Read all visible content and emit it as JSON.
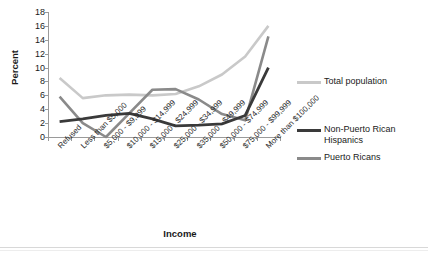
{
  "chart_data": {
    "type": "line",
    "title": "",
    "xlabel": "Income",
    "ylabel": "Percent",
    "ylim": [
      0,
      18
    ],
    "ytick_step": 2,
    "yticks": [
      0,
      2,
      4,
      6,
      8,
      10,
      12,
      14,
      16,
      18
    ],
    "grid": false,
    "legend_position": "right",
    "categories": [
      "Refused",
      "Less than $5,000",
      "$5,000 - $9,999",
      "$10,000 - $14,999",
      "$15,000 - $24,999",
      "$25,000 - $34,999",
      "$35,000 - $49,999",
      "$50,000 - $74,999",
      "$75,000 - $99,999",
      "More than $100,000"
    ],
    "series": [
      {
        "name": "Total population",
        "color": "#c9c9c9",
        "values": [
          8.5,
          5.6,
          6.0,
          6.1,
          6.0,
          6.2,
          7.3,
          9.0,
          11.6,
          16.0
        ]
      },
      {
        "name": "Non-Puerto Rican Hispanics",
        "color": "#3a3a3a",
        "values": [
          2.2,
          2.6,
          3.1,
          3.4,
          2.6,
          1.6,
          1.7,
          1.9,
          3.1,
          4.0
        ]
      },
      {
        "name": "Puerto Ricans",
        "color": "#8a8a8a",
        "values": [
          5.8,
          2.0,
          0.0,
          3.4,
          6.8,
          6.9,
          5.4,
          3.3,
          2.4,
          3.2
        ]
      }
    ],
    "series_endpoints": {
      "non_puerto_rican_hispanics_final": 10.0,
      "puerto_ricans_final": 14.5
    }
  },
  "axes": {
    "y_title": "Percent",
    "x_title": "Income",
    "y_tick_labels": [
      "18",
      "16",
      "14",
      "12",
      "10",
      "8",
      "6",
      "4",
      "2",
      "0"
    ]
  },
  "legend": {
    "items": [
      {
        "label": "Total population",
        "color": "#c9c9c9"
      },
      {
        "label": "Non-Puerto Rican Hispanics",
        "color": "#3a3a3a"
      },
      {
        "label": "Puerto Ricans",
        "color": "#8a8a8a"
      }
    ]
  },
  "title_strip": {
    "text": ""
  }
}
